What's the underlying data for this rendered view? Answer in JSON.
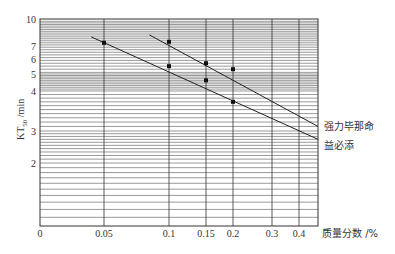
{
  "chart_data": {
    "type": "line",
    "title": "",
    "xlabel": "质量分数 /%",
    "ylabel": "KT50 /min",
    "ylabel_main": "KT",
    "ylabel_sub": "50",
    "ylabel_unit": " /min",
    "x_scale": "log",
    "y_scale": "log",
    "xlim": [
      0,
      0.5
    ],
    "ylim": [
      1,
      10
    ],
    "x_ticks": [
      {
        "label": "0",
        "value": 0
      },
      {
        "label": "0.05",
        "value": 0.05
      },
      {
        "label": "0.1",
        "value": 0.1
      },
      {
        "label": "0.15",
        "value": 0.15
      },
      {
        "label": "0.2",
        "value": 0.2
      },
      {
        "label": "0.3",
        "value": 0.3
      },
      {
        "label": "0.4",
        "value": 0.4
      }
    ],
    "y_ticks": [
      {
        "label": "10",
        "value": 10
      },
      {
        "label": "7",
        "value": 7
      },
      {
        "label": "6",
        "value": 6
      },
      {
        "label": "5",
        "value": 5
      },
      {
        "label": "4",
        "value": 4
      },
      {
        "label": "3",
        "value": 3
      },
      {
        "label": "2",
        "value": 2
      }
    ],
    "grid": true,
    "series": [
      {
        "name": "强力毕那命",
        "points": [
          {
            "x": 0.1,
            "y": 7.4
          },
          {
            "x": 0.15,
            "y": 5.7
          },
          {
            "x": 0.2,
            "y": 5.3
          }
        ],
        "fit_line": [
          {
            "x": 0.085,
            "y": 8.1
          },
          {
            "x": 0.5,
            "y": 3.1
          }
        ],
        "style": "solid"
      },
      {
        "name": "益必添",
        "points": [
          {
            "x": 0.05,
            "y": 7.3
          },
          {
            "x": 0.1,
            "y": 5.5
          },
          {
            "x": 0.15,
            "y": 4.6
          },
          {
            "x": 0.2,
            "y": 3.7
          }
        ],
        "fit_line": [
          {
            "x": 0.04,
            "y": 7.9
          },
          {
            "x": 0.5,
            "y": 2.7
          }
        ],
        "style": "solid"
      }
    ],
    "legend_position": "right"
  }
}
